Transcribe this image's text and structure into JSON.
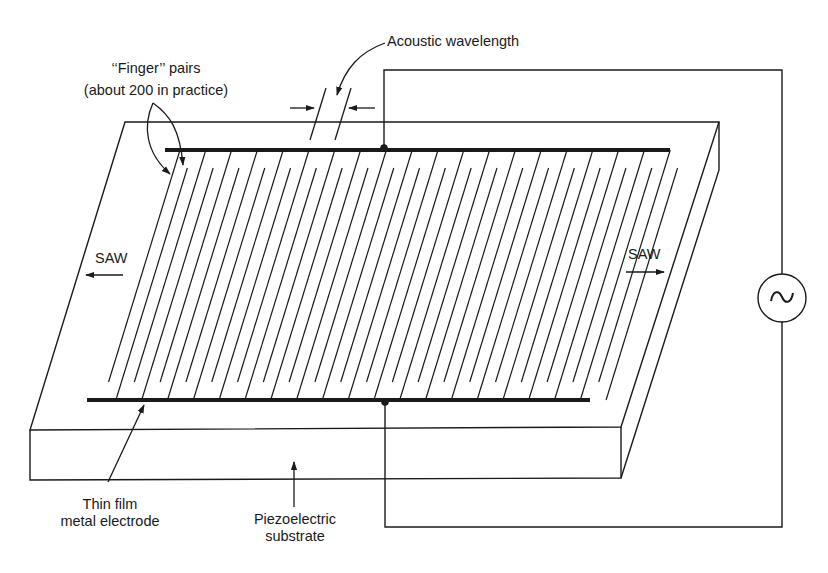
{
  "diagram": {
    "type": "surface-acoustic-wave-transducer",
    "labels": {
      "acoustic_wavelength": "Acoustic wavelength",
      "finger_pairs_line1": "‘‘Finger’’ pairs",
      "finger_pairs_line2": "(about 200 in practice)",
      "saw_left": "SAW",
      "saw_right": "SAW",
      "electrode_line1": "Thin film",
      "electrode_line2": "metal electrode",
      "substrate_line1": "Piezoelectric",
      "substrate_line2": "substrate"
    },
    "source_symbol": "~",
    "colors": {
      "line": "#1a1a1a",
      "background": "#ffffff"
    },
    "finger_count_drawn": 20
  }
}
